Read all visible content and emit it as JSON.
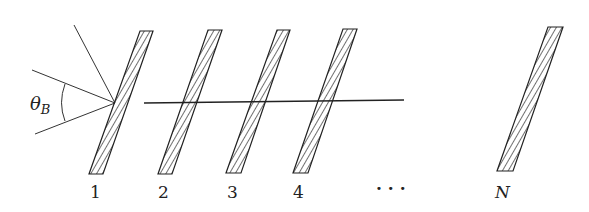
{
  "diagram": {
    "angle_label": "θ",
    "angle_subscript": "B",
    "plate_labels": [
      "1",
      "2",
      "3",
      "4",
      "· · ·",
      "N"
    ],
    "colors": {
      "ink": "#222222",
      "background": "#ffffff"
    }
  }
}
